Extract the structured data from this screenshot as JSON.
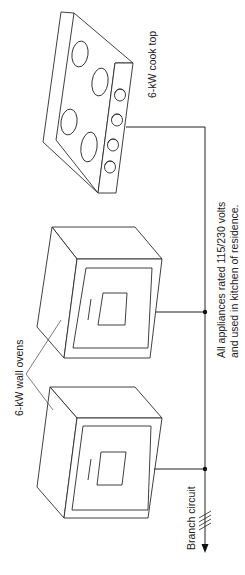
{
  "diagram": {
    "type": "wiring-diagram",
    "orientation": "rotated-90-ccw",
    "labels": {
      "cook_top": "6-kW cook top",
      "wall_ovens": "6-kW wall ovens",
      "note_line1": "All appliances rated 115/230 volts",
      "note_line2": "and used in kitchen of residence.",
      "branch_circuit": "Branch circuit"
    },
    "components": [
      {
        "id": "cook-top",
        "label": "6-kW cook top",
        "burners": 4,
        "knobs": 4
      },
      {
        "id": "wall-oven-1",
        "label": "6-kW wall ovens"
      },
      {
        "id": "wall-oven-2",
        "label": "6-kW wall ovens"
      }
    ],
    "conductor_marks": 4,
    "colors": {
      "line": "#2a2a2a",
      "background": "#ffffff"
    }
  }
}
